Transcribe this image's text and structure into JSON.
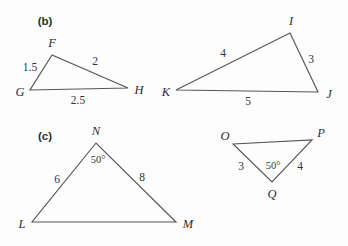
{
  "figure": {
    "background_color": "#fdfdfd",
    "stroke_color": "#55545c",
    "text_color": "#33323a",
    "width": 348,
    "height": 246
  },
  "parts": [
    {
      "key": "b",
      "label": "(b)",
      "x": 45,
      "y": 22
    },
    {
      "key": "c",
      "label": "(c)",
      "x": 45,
      "y": 137
    }
  ],
  "triangles": [
    {
      "id": "FGH",
      "part": "b",
      "vertices": [
        {
          "name": "F",
          "px": 52,
          "py": 55,
          "lx": 52,
          "ly": 43
        },
        {
          "name": "G",
          "px": 30,
          "py": 90,
          "lx": 20,
          "ly": 92
        },
        {
          "name": "H",
          "px": 128,
          "py": 88,
          "lx": 139,
          "ly": 90
        }
      ],
      "sides": [
        {
          "between": "FG",
          "value": "1.5",
          "lx": 30,
          "ly": 68
        },
        {
          "between": "FH",
          "value": "2",
          "lx": 95,
          "ly": 62
        },
        {
          "between": "GH",
          "value": "2.5",
          "lx": 78,
          "ly": 101
        }
      ],
      "angles": []
    },
    {
      "id": "IJK",
      "part": "b",
      "vertices": [
        {
          "name": "I",
          "px": 290,
          "py": 33,
          "lx": 291,
          "ly": 21
        },
        {
          "name": "J",
          "px": 318,
          "py": 92,
          "lx": 329,
          "ly": 94
        },
        {
          "name": "K",
          "px": 176,
          "py": 90,
          "lx": 166,
          "ly": 92
        }
      ],
      "sides": [
        {
          "between": "KI",
          "value": "4",
          "lx": 223,
          "ly": 54
        },
        {
          "between": "IJ",
          "value": "3",
          "lx": 311,
          "ly": 60
        },
        {
          "between": "KJ",
          "value": "5",
          "lx": 248,
          "ly": 102
        }
      ],
      "angles": []
    },
    {
      "id": "LMN",
      "part": "c",
      "vertices": [
        {
          "name": "N",
          "px": 96,
          "py": 143,
          "lx": 96,
          "ly": 131
        },
        {
          "name": "L",
          "px": 32,
          "py": 222,
          "lx": 22,
          "ly": 224
        },
        {
          "name": "M",
          "px": 176,
          "py": 222,
          "lx": 188,
          "ly": 224
        }
      ],
      "sides": [
        {
          "between": "LN",
          "value": "6",
          "lx": 57,
          "ly": 180
        },
        {
          "between": "NM",
          "value": "8",
          "lx": 142,
          "ly": 178
        },
        {
          "between": "LM",
          "value": "",
          "lx": 0,
          "ly": 0
        }
      ],
      "angles": [
        {
          "at": "N",
          "value": "50°",
          "lx": 98,
          "ly": 160
        }
      ]
    },
    {
      "id": "OPQ",
      "part": "c",
      "vertices": [
        {
          "name": "O",
          "px": 233,
          "py": 144,
          "lx": 225,
          "ly": 136
        },
        {
          "name": "P",
          "px": 312,
          "py": 140,
          "lx": 321,
          "ly": 133
        },
        {
          "name": "Q",
          "px": 272,
          "py": 182,
          "lx": 272,
          "ly": 194
        }
      ],
      "sides": [
        {
          "between": "OQ",
          "value": "3",
          "lx": 241,
          "ly": 167
        },
        {
          "between": "QP",
          "value": "4",
          "lx": 300,
          "ly": 167
        },
        {
          "between": "OP",
          "value": "",
          "lx": 0,
          "ly": 0
        }
      ],
      "angles": [
        {
          "at": "Q",
          "value": "50°",
          "lx": 273,
          "ly": 166
        }
      ]
    }
  ]
}
